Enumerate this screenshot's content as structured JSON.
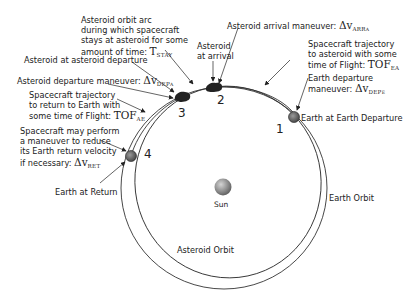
{
  "diagram": {
    "type": "orbital mission schematic",
    "bodies": {
      "sun_label": "Sun",
      "earth_orbit_label": "Earth Orbit",
      "asteroid_orbit_label": "Asteroid Orbit"
    },
    "phase_numbers": [
      "1",
      "2",
      "3",
      "4"
    ],
    "labels": {
      "stay_arc": {
        "lines": [
          "Asteroid orbit arc",
          "during which spacecraft",
          "stays at asteroid for some",
          "amount of time: "
        ],
        "symbol": "T",
        "subscript": "STAY"
      },
      "asteroid_arrival_maneuver": {
        "text": "Asteroid arrival maneuver: ",
        "symbol": "Δv",
        "subscript": "ARR",
        "sub_sub": "A"
      },
      "asteroid_at_arrival": {
        "lines": [
          "Asteroid",
          "at arrival"
        ]
      },
      "traj_to_asteroid": {
        "lines": [
          "Spacecraft trajectory",
          "to asteroid with some",
          "time of Flight: "
        ],
        "symbol": "TOF",
        "subscript": "EA"
      },
      "earth_departure_maneuver": {
        "lines": [
          "Earth departure",
          "maneuver: "
        ],
        "symbol": "Δv",
        "subscript": "DEP",
        "sub_sub": "E"
      },
      "earth_at_departure": {
        "text": "Earth at Earth Departure"
      },
      "asteroid_at_departure": {
        "text": "Asteroid at asteroid departure"
      },
      "asteroid_departure_maneuver": {
        "text": "Asteroid departure maneuver: ",
        "symbol": "Δv",
        "subscript": "DEP",
        "sub_sub": "A"
      },
      "traj_to_earth": {
        "lines": [
          "Spacecraft trajectory",
          "to return to Earth with",
          "some time of Flight: "
        ],
        "symbol": "TOF",
        "subscript": "AE"
      },
      "return_maneuver": {
        "lines": [
          "Spacecraft may perform",
          "a maneuver to reduce",
          "its Earth return velocity",
          "if necessary: "
        ],
        "symbol": "Δv",
        "subscript": "RET"
      },
      "earth_at_return": {
        "text": "Earth at Return"
      }
    },
    "colors": {
      "line": "#333333",
      "sun_light": "#c8c8c8",
      "sun_dark": "#6a6a6a",
      "asteroid": "#222222",
      "earth": "#555555"
    }
  }
}
